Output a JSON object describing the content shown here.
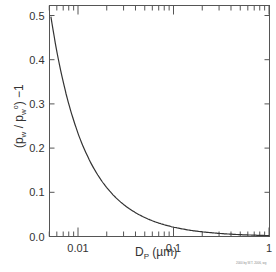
{
  "chart_data": {
    "type": "line",
    "title": "",
    "xlabel": "Dp (µm)",
    "ylabel": "(pw / pw°) −1",
    "xscale": "log",
    "xlim": [
      0.005,
      1
    ],
    "ylim": [
      0.0,
      0.52
    ],
    "x_ticks": [
      "0.01",
      "0.1",
      "1"
    ],
    "y_ticks": [
      "0.0",
      "0.1",
      "0.2",
      "0.3",
      "0.4",
      "0.5"
    ],
    "grid": false,
    "legend": null,
    "series": [
      {
        "name": "Kelvin effect",
        "x": [
          0.005,
          0.006,
          0.007,
          0.008,
          0.01,
          0.015,
          0.02,
          0.03,
          0.05,
          0.07,
          0.1,
          0.2,
          0.5,
          1.0
        ],
        "y": [
          0.52,
          0.42,
          0.35,
          0.3,
          0.23,
          0.15,
          0.11,
          0.072,
          0.043,
          0.03,
          0.021,
          0.011,
          0.004,
          0.002
        ]
      }
    ]
  },
  "axis": {
    "y_label": "(p",
    "y_label_full": "(pw / pw°) −1",
    "x_label_full": "Dp (µm)"
  },
  "credit": "2000 by W.T. 2006, wg"
}
